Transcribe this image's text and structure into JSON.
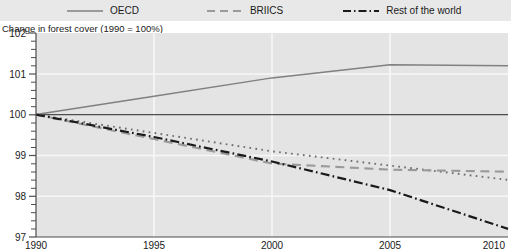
{
  "chart_data": {
    "type": "line",
    "title": "",
    "subtitle": "",
    "ylabel": "Change in forest cover (1990 = 100%)",
    "xlabel": "",
    "xlim": [
      1990,
      2010
    ],
    "ylim": [
      97,
      102
    ],
    "yticks": [
      97,
      98,
      99,
      100,
      101,
      102
    ],
    "xticks": [
      1990,
      1995,
      2000,
      2005,
      2010
    ],
    "grid": true,
    "legend_position": "top",
    "baseline": 100,
    "x": [
      1990,
      1995,
      2000,
      2005,
      2010
    ],
    "series": [
      {
        "name": "OECD",
        "style": "solid",
        "color": "#808080",
        "values": [
          100.0,
          100.45,
          100.9,
          101.22,
          101.2
        ]
      },
      {
        "name": "BRIICS",
        "style": "dashed",
        "color": "#a0a0a0",
        "values": [
          100.0,
          99.4,
          98.8,
          98.65,
          98.6
        ]
      },
      {
        "name": "Rest of the world",
        "style": "dash-dot",
        "color": "#1a1a1a",
        "values": [
          100.0,
          99.45,
          98.85,
          98.15,
          97.2
        ]
      },
      {
        "name": "World",
        "style": "dotted",
        "color": "#8c8c8c",
        "values": [
          100.0,
          99.55,
          99.1,
          98.75,
          98.4
        ]
      }
    ]
  },
  "legend": {
    "items": [
      {
        "label": "OECD",
        "icon": "solid-line-swatch"
      },
      {
        "label": "BRIICS",
        "icon": "dashed-line-swatch"
      },
      {
        "label": "Rest of the world",
        "icon": "dash-dot-line-swatch"
      },
      {
        "label": "World",
        "icon": "dotted-line-swatch"
      }
    ]
  },
  "axis": {
    "title": "Change in forest cover (1990 = 100%)",
    "y_tick_labels": [
      "102",
      "101",
      "100",
      "99",
      "98",
      "97"
    ],
    "x_tick_labels": [
      "1990",
      "1995",
      "2000",
      "2005",
      "2010"
    ]
  },
  "colors": {
    "legend_background": "#e8e8e8",
    "plot_background": "#e4e4e4",
    "gridline": "#f5f5f5",
    "axis": "#4d4d4d",
    "baseline": "#4d4d4d",
    "text": "#1a1a1a"
  }
}
